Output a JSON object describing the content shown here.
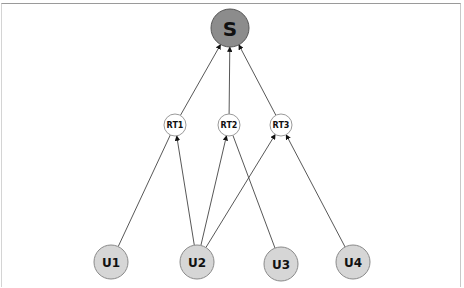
{
  "diagram": {
    "type": "hierarchical-graph",
    "nodes": [
      {
        "id": "S",
        "label": "S",
        "x": 230,
        "y": 28,
        "r": 19,
        "fill": "#8c8c8c",
        "stroke": "#555555",
        "font_size": 20,
        "tier": "server"
      },
      {
        "id": "RT1",
        "label": "RT1",
        "x": 175,
        "y": 125,
        "r": 11,
        "fill": "#ffffff",
        "stroke": "#9a9a9a",
        "font_size": 8,
        "tier": "relay"
      },
      {
        "id": "RT2",
        "label": "RT2",
        "x": 229,
        "y": 125,
        "r": 11,
        "fill": "#ffffff",
        "stroke": "#9a9a9a",
        "font_size": 8,
        "tier": "relay"
      },
      {
        "id": "RT3",
        "label": "RT3",
        "x": 281,
        "y": 125,
        "r": 11,
        "fill": "#ffffff",
        "stroke": "#9a9a9a",
        "font_size": 8,
        "tier": "relay"
      },
      {
        "id": "U1",
        "label": "U1",
        "x": 111,
        "y": 262,
        "r": 17,
        "fill": "#d6d6d6",
        "stroke": "#8a8a8a",
        "font_size": 12,
        "tier": "user"
      },
      {
        "id": "U2",
        "label": "U2",
        "x": 197,
        "y": 262,
        "r": 17,
        "fill": "#d6d6d6",
        "stroke": "#8a8a8a",
        "font_size": 12,
        "tier": "user"
      },
      {
        "id": "U3",
        "label": "U3",
        "x": 281,
        "y": 264,
        "r": 17,
        "fill": "#d6d6d6",
        "stroke": "#8a8a8a",
        "font_size": 12,
        "tier": "user"
      },
      {
        "id": "U4",
        "label": "U4",
        "x": 353,
        "y": 262,
        "r": 17,
        "fill": "#d6d6d6",
        "stroke": "#8a8a8a",
        "font_size": 12,
        "tier": "user"
      }
    ],
    "edges": [
      {
        "from": "RT1",
        "to": "S",
        "arrow": true
      },
      {
        "from": "RT2",
        "to": "S",
        "arrow": true
      },
      {
        "from": "RT3",
        "to": "S",
        "arrow": true
      },
      {
        "from": "U1",
        "to": "RT1",
        "arrow": false
      },
      {
        "from": "U2",
        "to": "RT1",
        "arrow": true
      },
      {
        "from": "U2",
        "to": "RT2",
        "arrow": true
      },
      {
        "from": "U2",
        "to": "RT3",
        "arrow": true
      },
      {
        "from": "U3",
        "to": "RT2",
        "arrow": false
      },
      {
        "from": "U4",
        "to": "RT3",
        "arrow": true
      }
    ],
    "colors": {
      "edge": "#444444",
      "background": "#ffffff"
    }
  }
}
